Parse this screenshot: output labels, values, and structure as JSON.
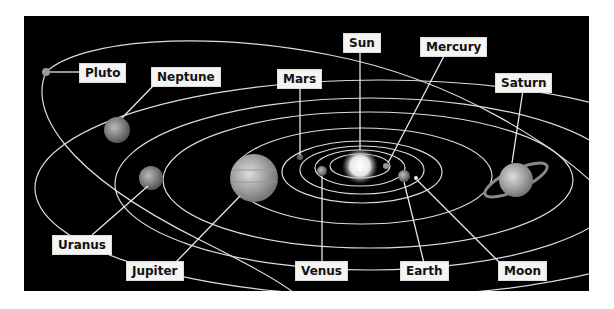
{
  "diagram": {
    "background": "#000000",
    "label_background": "#f4f4f4",
    "labels": {
      "sun": "Sun",
      "mercury": "Mercury",
      "venus": "Venus",
      "earth": "Earth",
      "moon": "Moon",
      "mars": "Mars",
      "jupiter": "Jupiter",
      "saturn": "Saturn",
      "uranus": "Uranus",
      "neptune": "Neptune",
      "pluto": "Pluto"
    }
  }
}
